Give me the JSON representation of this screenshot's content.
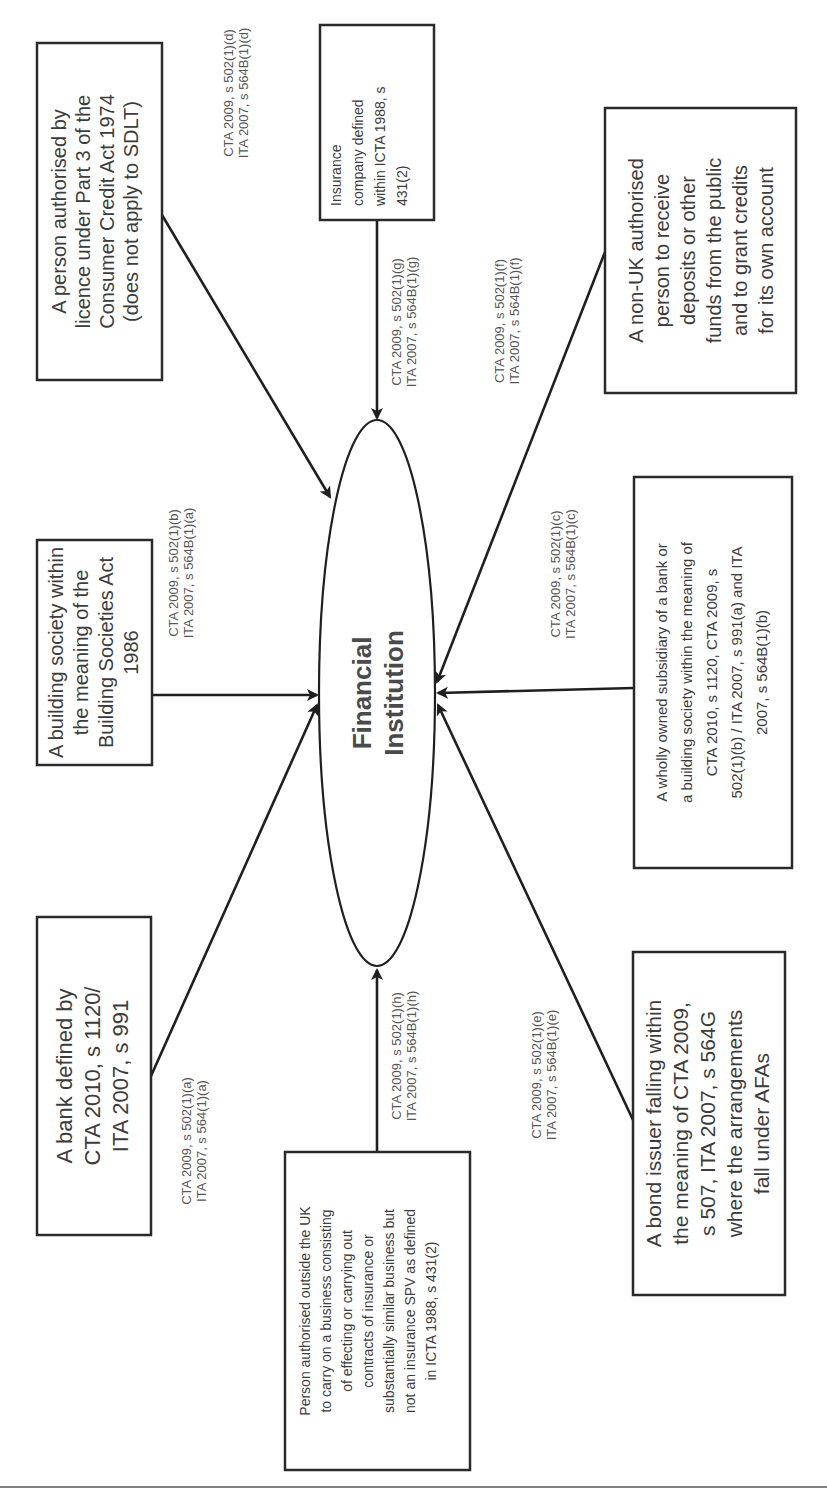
{
  "diagram": {
    "orientation": "rotated-90-ccw",
    "center": {
      "line1": "Financial",
      "line2": "Institution"
    },
    "nodes": [
      {
        "id": "consumer-credit",
        "lines": [
          "A person authorised by",
          "licence under Part 3 of the",
          "Consumer Credit Act 1974",
          "(does not apply to SDLT)"
        ],
        "ref": [
          "CTA 2009, s 502(1)(d)",
          "ITA 2007, s 564B(1)(d)"
        ]
      },
      {
        "id": "insurance-company",
        "lines": [
          "Insurance",
          "company defined",
          "within ICTA 1988, s",
          "431(2)"
        ],
        "ref": [
          "CTA 2009, s 502(1)(g)",
          "ITA 2007, s 564B(1)(g)"
        ]
      },
      {
        "id": "non-uk-authorised",
        "lines": [
          "A non-UK authorised",
          "person to receive",
          "deposits or other",
          "funds from the public",
          "and to grant credits",
          "for its own account"
        ],
        "ref": [
          "CTA 2009, s 502(1)(f)",
          "ITA 2007, s 564B(1)(f)"
        ]
      },
      {
        "id": "building-society",
        "lines": [
          "A building society within",
          "the meaning of the",
          "Building Societies Act",
          "1986"
        ],
        "ref": [
          "CTA 2009, s 502(1)(b)",
          "ITA 2007, s 564B(1)(a)"
        ]
      },
      {
        "id": "wholly-owned-subsidiary",
        "lines": [
          "A wholly owned subsidiary of a bank or",
          "a building society within the meaning of",
          "CTA 2010, s 1120, CTA 2009, s",
          "502(1)(b) / ITA 2007, s 991(a) and ITA",
          "2007, s 564B(1)(b)"
        ],
        "ref": [
          "CTA 2009, s 502(1)(c)",
          "ITA 2007, s 564B(1)(c)"
        ]
      },
      {
        "id": "bank",
        "lines": [
          "A bank defined by",
          "CTA 2010, s 1120/",
          "ITA 2007, s 991"
        ],
        "ref": [
          "CTA 2009, s 502(1)(a)",
          "ITA 2007, s 564(1)(a)"
        ]
      },
      {
        "id": "overseas-insurer",
        "lines": [
          "Person authorised outside the UK",
          "to carry on a business consisting",
          "of effecting or carrying out",
          "contracts of insurance or",
          "substantially similar business but",
          "not an insurance SPV as defined",
          "in ICTA 1988, s 431(2)"
        ],
        "ref": [
          "CTA 2009, s 502(1)(h)",
          "ITA 2007, s 564B(1)(h)"
        ]
      },
      {
        "id": "bond-issuer",
        "lines": [
          "A bond issuer falling within",
          "the meaning of CTA 2009,",
          "s 507, ITA 2007, s 564G",
          "where the arrangements",
          "fall under AFAs"
        ],
        "ref": [
          "CTA 2009, s 502(1)(e)",
          "ITA 2007, s 564B(1)(e)"
        ]
      }
    ],
    "colors": {
      "stroke": "#1f1f1f",
      "text": "#3c3c3c",
      "background": "#ffffff"
    }
  }
}
